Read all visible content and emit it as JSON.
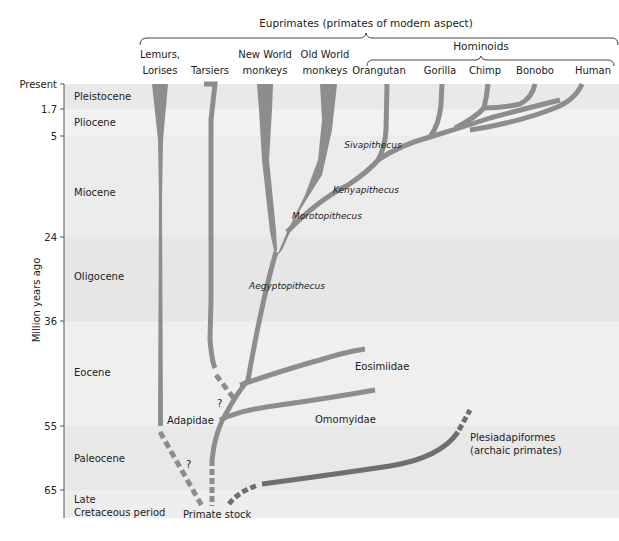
{
  "title": "Euprimates (primates of modern aspect)",
  "hominoids_label": "Hominoids",
  "axis": {
    "label": "Million years ago",
    "ticks": [
      {
        "label": "Present",
        "y": 84
      },
      {
        "label": "1.7",
        "y": 109
      },
      {
        "label": "5",
        "y": 136
      },
      {
        "label": "24",
        "y": 237
      },
      {
        "label": "36",
        "y": 321
      },
      {
        "label": "55",
        "y": 426
      },
      {
        "label": "65",
        "y": 490
      }
    ]
  },
  "periods": [
    {
      "name": "Pleistocene",
      "y0": 84,
      "y1": 109,
      "label_y": 100,
      "fill": "#e9e9e9"
    },
    {
      "name": "Pliocene",
      "y0": 109,
      "y1": 136,
      "label_y": 126,
      "fill": "#f1f1f1"
    },
    {
      "name": "Miocene",
      "y0": 136,
      "y1": 237,
      "label_y": 196,
      "fill": "#ececec"
    },
    {
      "name": "Oligocene",
      "y0": 237,
      "y1": 321,
      "label_y": 280,
      "fill": "#e6e6e6"
    },
    {
      "name": "Eocene",
      "y0": 321,
      "y1": 426,
      "label_y": 376,
      "fill": "#efefef"
    },
    {
      "name": "Paleocene",
      "y0": 426,
      "y1": 490,
      "label_y": 462,
      "fill": "#e8e8e8"
    },
    {
      "name": "Late",
      "name2": "Cretaceous period",
      "y0": 490,
      "y1": 518,
      "label_y": 503,
      "fill": "#eeeeee"
    }
  ],
  "taxa": [
    {
      "line1": "Lemurs,",
      "line2": "Lorises",
      "x": 160
    },
    {
      "line1": "",
      "line2": "Tarsiers",
      "x": 210
    },
    {
      "line1": "New World",
      "line2": "monkeys",
      "x": 265
    },
    {
      "line1": "Old World",
      "line2": "monkeys",
      "x": 325
    },
    {
      "line1": "",
      "line2": "Orangutan",
      "x": 379
    },
    {
      "line1": "",
      "line2": "Gorilla",
      "x": 440
    },
    {
      "line1": "",
      "line2": "Chimp",
      "x": 485
    },
    {
      "line1": "",
      "line2": "Bonobo",
      "x": 535
    },
    {
      "line1": "",
      "line2": "Human",
      "x": 593
    }
  ],
  "fossil_labels": [
    {
      "text": "Sivapithecus",
      "x": 373,
      "y": 148,
      "italic": true
    },
    {
      "text": "Kenyapithecus",
      "x": 366,
      "y": 193,
      "italic": true
    },
    {
      "text": "Morotopithecus",
      "x": 327,
      "y": 219,
      "italic": true
    },
    {
      "text": "Aegyptopithecus",
      "x": 287,
      "y": 289,
      "italic": true
    }
  ],
  "group_labels": [
    {
      "text": "Eosimiidae",
      "x": 355,
      "y": 370
    },
    {
      "text": "Omomyidae",
      "x": 315,
      "y": 423
    },
    {
      "text": "Adapidae",
      "x": 167,
      "y": 424
    },
    {
      "text": "Plesiadapiformes",
      "x": 470,
      "y": 441
    },
    {
      "text": "(archaic primates)",
      "x": 470,
      "y": 454
    },
    {
      "text": "Primate stock",
      "x": 183,
      "y": 518
    },
    {
      "text": "?",
      "x": 217,
      "y": 407
    },
    {
      "text": "?",
      "x": 186,
      "y": 468
    }
  ],
  "colors": {
    "branch": "#8d8d8d",
    "archaic_branch": "#6f6f6f",
    "text": "#222222"
  }
}
